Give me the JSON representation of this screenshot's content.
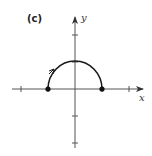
{
  "figure": {
    "panel_label": "(c)",
    "x_axis_label": "x",
    "y_axis_label": "y",
    "colors": {
      "axis": "#555555",
      "curve": "#1a1a1a",
      "point": "#111111",
      "background": "#ffffff"
    }
  },
  "diagram": {
    "type": "parametric-curve-graph",
    "curve": {
      "shape": "upper-semicircle",
      "center": [
        0,
        0
      ],
      "radius": 1,
      "start_point": [
        -1,
        0
      ],
      "end_point": [
        1,
        0
      ],
      "orientation": "left-to-right"
    },
    "endpoints": [
      [
        -1,
        0
      ],
      [
        1,
        0
      ]
    ],
    "x_ticks": [
      -2,
      -1,
      1,
      2
    ],
    "y_ticks": [
      -2,
      -1,
      1,
      2
    ]
  }
}
